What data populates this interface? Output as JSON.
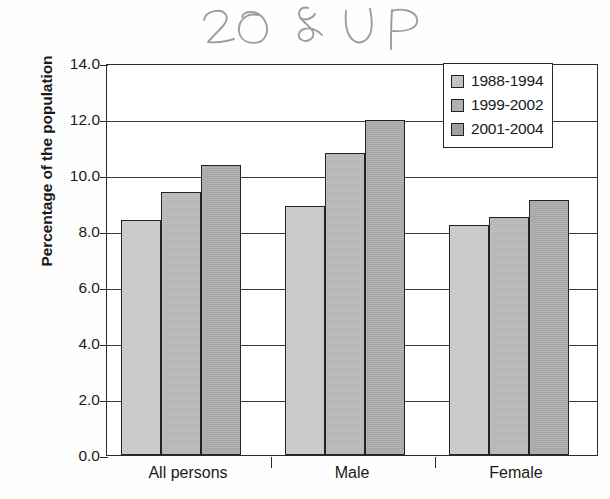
{
  "annotation": {
    "text": "20 & UP",
    "kind": "handwritten-pencil",
    "color": "#9a9a9a"
  },
  "chart_data": {
    "type": "bar",
    "title": "",
    "xlabel": "",
    "ylabel": "Percentage of the population",
    "ylim": [
      0.0,
      14.0
    ],
    "ytick_step": 2.0,
    "ytick_labels": [
      "14.0",
      "12.0",
      "10.0",
      "8.0",
      "6.0",
      "4.0",
      "2.0",
      "0.0"
    ],
    "ytick_values": [
      14.0,
      12.0,
      10.0,
      8.0,
      6.0,
      4.0,
      2.0,
      0.0
    ],
    "grid": true,
    "grid_axis": "y",
    "legend_position": "top-right",
    "categories": [
      "All persons",
      "Male",
      "Female"
    ],
    "series": [
      {
        "name": "1988-1994",
        "color": "#c3c3c3",
        "values": [
          8.4,
          8.9,
          8.2
        ]
      },
      {
        "name": "1999-2002",
        "color": "#b0b0b0",
        "values": [
          9.4,
          10.8,
          8.5
        ]
      },
      {
        "name": "2001-2004",
        "color": "#a0a0a0",
        "values": [
          10.35,
          11.95,
          9.1
        ]
      }
    ]
  },
  "legend": {
    "items": [
      {
        "label": "1988-1994",
        "color": "#c3c3c3"
      },
      {
        "label": "1999-2002",
        "color": "#b0b0b0"
      },
      {
        "label": "2001-2004",
        "color": "#a0a0a0"
      }
    ]
  },
  "colors": {
    "axis": "#2b2b2b",
    "gridline": "#3a3a3a",
    "bar_border": "#232323",
    "background": "#ffffff"
  }
}
